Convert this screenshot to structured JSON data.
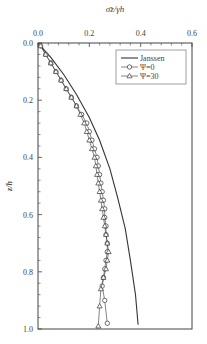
{
  "chart_data": {
    "type": "line",
    "title": "",
    "xlabel": "σ̄z/γh",
    "ylabel": "z/h",
    "xlim": [
      0.0,
      0.6
    ],
    "ylim": [
      0.0,
      1.0
    ],
    "y_inverted": true,
    "x_axis_position": "top",
    "x_ticks": [
      "0.0",
      "0.2",
      "0.4",
      "0.6"
    ],
    "y_ticks": [
      "0.0",
      "0.2",
      "0.4",
      "0.6",
      "0.8",
      "1.0"
    ],
    "grid": false,
    "legend_position": "upper right",
    "series": [
      {
        "name": "Janssen",
        "marker": "none",
        "x": [
          0.0,
          0.05,
          0.1,
          0.15,
          0.2,
          0.24,
          0.28,
          0.31,
          0.34,
          0.36,
          0.38,
          0.39
        ],
        "y": [
          0.0,
          0.05,
          0.11,
          0.18,
          0.26,
          0.34,
          0.44,
          0.54,
          0.65,
          0.76,
          0.88,
          0.985
        ]
      },
      {
        "name": "Ψ=0",
        "marker": "circle",
        "x": [
          0.01,
          0.03,
          0.05,
          0.07,
          0.09,
          0.11,
          0.13,
          0.15,
          0.17,
          0.19,
          0.2,
          0.21,
          0.22,
          0.23,
          0.235,
          0.24,
          0.245,
          0.25,
          0.255,
          0.26,
          0.26,
          0.265,
          0.265,
          0.27,
          0.27,
          0.265,
          0.26,
          0.255,
          0.25,
          0.26,
          0.27
        ],
        "y": [
          0.01,
          0.04,
          0.07,
          0.1,
          0.13,
          0.16,
          0.19,
          0.22,
          0.25,
          0.28,
          0.31,
          0.34,
          0.37,
          0.4,
          0.43,
          0.46,
          0.49,
          0.52,
          0.55,
          0.58,
          0.61,
          0.64,
          0.67,
          0.7,
          0.73,
          0.76,
          0.79,
          0.82,
          0.85,
          0.9,
          0.98
        ]
      },
      {
        "name": "Ψ=30",
        "marker": "triangle",
        "x": [
          0.01,
          0.03,
          0.05,
          0.07,
          0.09,
          0.11,
          0.13,
          0.15,
          0.165,
          0.18,
          0.19,
          0.2,
          0.21,
          0.22,
          0.225,
          0.23,
          0.235,
          0.24,
          0.245,
          0.25,
          0.255,
          0.26,
          0.265,
          0.27,
          0.275,
          0.27,
          0.265,
          0.255,
          0.245,
          0.24,
          0.235
        ],
        "y": [
          0.01,
          0.04,
          0.07,
          0.1,
          0.13,
          0.16,
          0.19,
          0.22,
          0.25,
          0.28,
          0.31,
          0.34,
          0.37,
          0.4,
          0.43,
          0.46,
          0.49,
          0.52,
          0.55,
          0.58,
          0.61,
          0.64,
          0.67,
          0.7,
          0.73,
          0.76,
          0.79,
          0.82,
          0.86,
          0.92,
          0.99
        ]
      }
    ]
  }
}
